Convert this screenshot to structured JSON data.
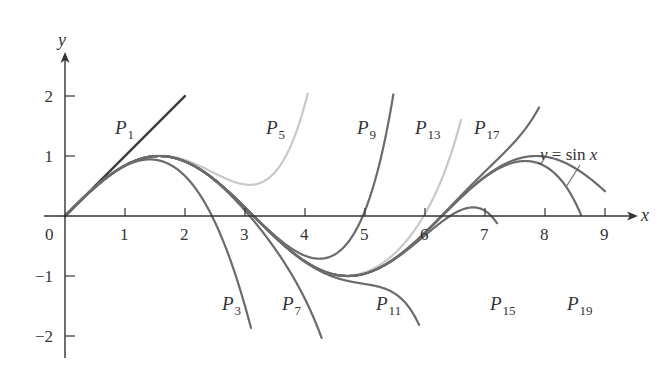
{
  "chart_data": {
    "type": "line",
    "title": "",
    "xlabel": "x",
    "ylabel": "y",
    "xlim": [
      0,
      9.3
    ],
    "ylim": [
      -2.2,
      2.4
    ],
    "grid": false,
    "legend": "none (inline curve labels)",
    "x_ticks": [
      1,
      2,
      3,
      4,
      5,
      6,
      7,
      8,
      9
    ],
    "x_tick_labels": [
      "0",
      "1",
      "2",
      "3",
      "4",
      "5",
      "6",
      "7",
      "8",
      "9"
    ],
    "y_ticks": [
      -2,
      -1,
      1,
      2
    ],
    "y_tick_labels": [
      "−2",
      "−1",
      "1",
      "2"
    ],
    "function": "sin x",
    "series": [
      {
        "name": "y = sin x",
        "degree": null,
        "color": "#6b6b6b",
        "x_range": [
          0,
          9
        ],
        "label_pos": [
          555,
          160
        ],
        "leader": [
          [
            580,
            166
          ],
          [
            566,
            187
          ]
        ]
      },
      {
        "name": "P1",
        "base": "P",
        "sub": "1",
        "degree": 1,
        "color": "#3a3a3a",
        "x_range": [
          0,
          2
        ],
        "label_pos": [
          115,
          134
        ]
      },
      {
        "name": "P3",
        "base": "P",
        "sub": "3",
        "degree": 3,
        "color": "#6b6b6b",
        "x_range": [
          0,
          3.1
        ],
        "label_pos": [
          222,
          310
        ]
      },
      {
        "name": "P5",
        "base": "P",
        "sub": "5",
        "degree": 5,
        "color": "#c8c8c8",
        "x_range": [
          0,
          4.1
        ],
        "label_pos": [
          266,
          134
        ]
      },
      {
        "name": "P7",
        "base": "P",
        "sub": "7",
        "degree": 7,
        "color": "#6b6b6b",
        "x_range": [
          0,
          4.7
        ],
        "label_pos": [
          282,
          310
        ]
      },
      {
        "name": "P9",
        "base": "P",
        "sub": "9",
        "degree": 9,
        "color": "#6b6b6b",
        "x_range": [
          0,
          5.5
        ],
        "label_pos": [
          357,
          134
        ]
      },
      {
        "name": "P11",
        "base": "P",
        "sub": "11",
        "degree": 11,
        "color": "#6b6b6b",
        "x_range": [
          0,
          5.9
        ],
        "label_pos": [
          376,
          310
        ]
      },
      {
        "name": "P13",
        "base": "P",
        "sub": "13",
        "degree": 13,
        "color": "#c8c8c8",
        "x_range": [
          0,
          6.6
        ],
        "label_pos": [
          415,
          134
        ]
      },
      {
        "name": "P15",
        "base": "P",
        "sub": "15",
        "degree": 15,
        "color": "#6b6b6b",
        "x_range": [
          0,
          7.2
        ],
        "label_pos": [
          490,
          310
        ]
      },
      {
        "name": "P17",
        "base": "P",
        "sub": "17",
        "degree": 17,
        "color": "#6b6b6b",
        "x_range": [
          0,
          7.9
        ],
        "label_pos": [
          474,
          134
        ]
      },
      {
        "name": "P19",
        "base": "P",
        "sub": "19",
        "degree": 19,
        "color": "#6b6b6b",
        "x_range": [
          0,
          8.6
        ],
        "label_pos": [
          567,
          310
        ]
      }
    ],
    "annotations": [
      "y = sin x"
    ]
  },
  "axes": {
    "x_label": "x",
    "y_label": "y",
    "origin_label": "0"
  },
  "sin_label": {
    "y": "y",
    "eq": " = sin ",
    "x": "x"
  },
  "colors": {
    "axis": "#333333",
    "dark_curve": "#3a3a3a",
    "mid_curve": "#6b6b6b",
    "light_curve": "#c8c8c8"
  }
}
